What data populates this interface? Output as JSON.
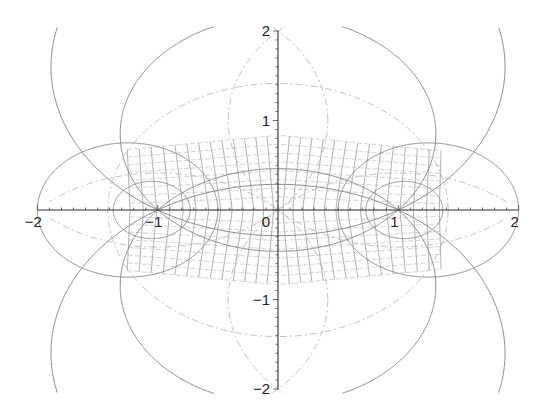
{
  "chart_data": {
    "type": "line",
    "title": "",
    "xlabel": "",
    "ylabel": "",
    "xlim": [
      -2,
      2
    ],
    "ylim": [
      -2,
      2
    ],
    "grid": false,
    "legend": null,
    "x_ticks": [
      "-2",
      "-1",
      "0",
      "1",
      "2"
    ],
    "y_ticks": [
      "-2",
      "-1",
      "1",
      "2"
    ],
    "x_tick_values": [
      -2,
      -1,
      0,
      1,
      2
    ],
    "y_tick_values": [
      -2,
      -1,
      1,
      2
    ],
    "series": [
      {
        "name": "solid circles (sigma = const), centered on y-axis",
        "style": "solid",
        "circles": [
          {
            "cx": 0,
            "cy": 1.6,
            "r": 1.887
          },
          {
            "cx": 0,
            "cy": -1.6,
            "r": 1.887
          },
          {
            "cx": 0,
            "cy": 0.85,
            "r": 1.312
          },
          {
            "cx": 0,
            "cy": -0.85,
            "r": 1.312
          }
        ]
      },
      {
        "name": "solid circles (tau = const), centered on x-axis",
        "style": "solid",
        "circles": [
          {
            "cx": -1.25,
            "cy": 0,
            "r": 0.75
          },
          {
            "cx": 1.25,
            "cy": 0,
            "r": 0.75
          },
          {
            "cx": -1.05,
            "cy": 0,
            "r": 0.32
          },
          {
            "cx": 1.05,
            "cy": 0,
            "r": 0.32
          }
        ]
      },
      {
        "name": "dash-dot circles",
        "style": "dashdot",
        "circles": [
          {
            "cx": 0,
            "cy": 0,
            "r": 1.414
          },
          {
            "cx": -1.0,
            "cy": 1.0,
            "r": 1.414
          },
          {
            "cx": 1.0,
            "cy": 1.0,
            "r": 1.414
          },
          {
            "cx": -1.0,
            "cy": -1.0,
            "r": 1.414
          },
          {
            "cx": 1.0,
            "cy": -1.0,
            "r": 1.414
          }
        ]
      },
      {
        "name": "mapped mesh",
        "style": "thin grid",
        "x_range": [
          -1.2,
          1.3
        ],
        "y_range": [
          -0.78,
          0.78
        ],
        "nx": 26,
        "ny": 16
      }
    ]
  }
}
